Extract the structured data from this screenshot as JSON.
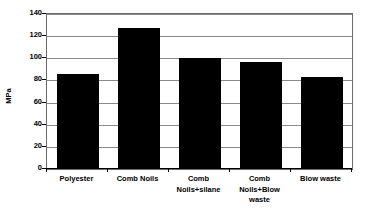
{
  "chart_data": {
    "type": "bar",
    "title": "",
    "subtitle": "",
    "xlabel": "",
    "ylabel": "MPa",
    "ylim": [
      0,
      140
    ],
    "ytick_step": 20,
    "yticks": [
      0,
      20,
      40,
      60,
      80,
      100,
      120,
      140
    ],
    "ytick_labels": [
      "0",
      "20",
      "40",
      "60",
      "80",
      "100",
      "120",
      "140"
    ],
    "grid": true,
    "grid_axis": "y",
    "legend": false,
    "legend_position": "none",
    "bar_color": "#000000",
    "plot_background": "#ffffff",
    "gridline_color": "#8a8a8a",
    "axis_color": "#000000",
    "categories": [
      "Polyester",
      "Comb Noils",
      "Comb Noils+silane",
      "Comb Noils+Blow waste",
      "Blow waste"
    ],
    "category_label_lines": [
      [
        "Polyester"
      ],
      [
        "Comb Noils"
      ],
      [
        "Comb",
        "Noils+silane"
      ],
      [
        "Comb",
        "Noils+Blow",
        "waste"
      ],
      [
        "Blow waste"
      ]
    ],
    "values": [
      86,
      127,
      100,
      97,
      83
    ],
    "units": "MPa",
    "annotations": []
  }
}
